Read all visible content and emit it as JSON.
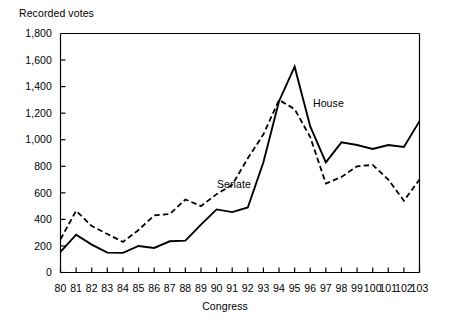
{
  "chart_data": {
    "type": "line",
    "title": "",
    "subtitle": "",
    "xlabel": "Congress",
    "ylabel": "Recorded votes",
    "xlim": [
      80,
      103
    ],
    "ylim": [
      0,
      1800
    ],
    "ytick_step": 200,
    "grid": false,
    "legend_position": "inline-annotation",
    "x": [
      80,
      81,
      82,
      83,
      84,
      85,
      86,
      87,
      88,
      89,
      90,
      91,
      92,
      93,
      94,
      95,
      96,
      97,
      98,
      99,
      100,
      101,
      102,
      103
    ],
    "categories": [
      "80",
      "81",
      "82",
      "83",
      "84",
      "85",
      "86",
      "87",
      "88",
      "89",
      "90",
      "91",
      "92",
      "93",
      "94",
      "95",
      "96",
      "97",
      "98",
      "99",
      "100",
      "101",
      "102",
      "103"
    ],
    "ytick_labels": [
      "0",
      "200",
      "400",
      "600",
      "800",
      "1,000",
      "1,200",
      "1,400",
      "1,600",
      "1,800"
    ],
    "ytick_values": [
      0,
      200,
      400,
      600,
      800,
      1000,
      1200,
      1400,
      1600,
      1800
    ],
    "series": [
      {
        "name": "House",
        "style": "solid",
        "color": "#000000",
        "label_annotation": "House",
        "values": [
          155,
          285,
          210,
          150,
          148,
          200,
          185,
          235,
          240,
          360,
          475,
          455,
          490,
          830,
          1290,
          1550,
          1100,
          830,
          980,
          960,
          930,
          960,
          945,
          1140
        ]
      },
      {
        "name": "Senate",
        "style": "dashed",
        "color": "#000000",
        "label_annotation": "Senate",
        "values": [
          250,
          465,
          350,
          290,
          230,
          320,
          430,
          440,
          550,
          500,
          590,
          660,
          860,
          1040,
          1300,
          1230,
          1020,
          670,
          720,
          800,
          810,
          700,
          540,
          700
        ]
      }
    ]
  },
  "annotations": {
    "senate_label": "Senate",
    "house_label": "House"
  }
}
